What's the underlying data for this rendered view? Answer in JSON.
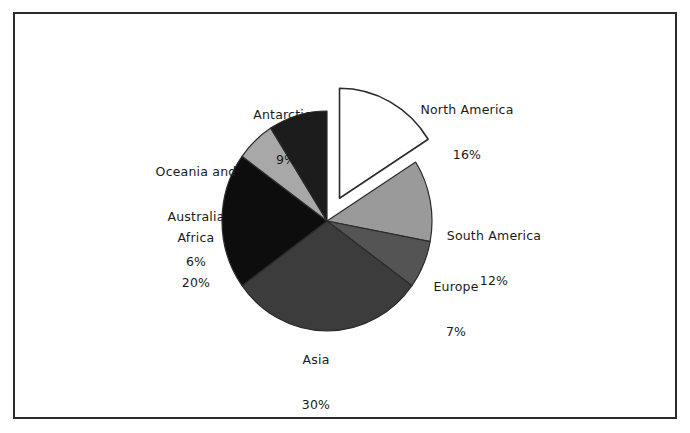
{
  "figure": {
    "background_color": "#ffffff",
    "border_color": "#2b2b2b",
    "label_text_color": "#1a1a1a"
  },
  "chart_data": {
    "type": "pie",
    "title": "",
    "subtitle": "",
    "xlabel": "",
    "ylabel": "",
    "legend_position": "none",
    "grid": false,
    "value_unit": "%",
    "start_angle_deg": 0,
    "direction": "clockwise",
    "labels_inline": true,
    "categories": [
      "North America",
      "South America",
      "Europe",
      "Asia",
      "Africa",
      "Oceania and Australia",
      "Antarctica"
    ],
    "values": [
      16,
      12,
      7,
      30,
      20,
      6,
      9
    ],
    "value_labels": [
      "16%",
      "12%",
      "7%",
      "30%",
      "20%",
      "6%",
      "9%"
    ],
    "colors": [
      "#ffffff",
      "#9a9a9a",
      "#545454",
      "#3c3c3c",
      "#0d0d0d",
      "#a8a8a8",
      "#1c1c1c"
    ],
    "exploded": [
      true,
      false,
      false,
      false,
      false,
      false,
      false
    ],
    "slices": [
      {
        "name": "North America",
        "value": 16,
        "value_label": "16%",
        "color": "#ffffff",
        "edge_color": "#2b2b2b",
        "exploded": true,
        "label_lines": [
          "North America",
          "16%"
        ]
      },
      {
        "name": "South America",
        "value": 12,
        "value_label": "12%",
        "color": "#9a9a9a",
        "edge_color": "#2b2b2b",
        "exploded": false,
        "label_lines": [
          "South America",
          "12%"
        ]
      },
      {
        "name": "Europe",
        "value": 7,
        "value_label": "7%",
        "color": "#545454",
        "edge_color": "#2b2b2b",
        "exploded": false,
        "label_lines": [
          "Europe",
          "7%"
        ]
      },
      {
        "name": "Asia",
        "value": 30,
        "value_label": "30%",
        "color": "#3c3c3c",
        "edge_color": "#2b2b2b",
        "exploded": false,
        "label_lines": [
          "Asia",
          "30%"
        ]
      },
      {
        "name": "Africa",
        "value": 20,
        "value_label": "20%",
        "color": "#0d0d0d",
        "edge_color": "#2b2b2b",
        "exploded": false,
        "label_lines": [
          "Africa",
          "20%"
        ]
      },
      {
        "name": "Oceania and Australia",
        "value": 6,
        "value_label": "6%",
        "color": "#a8a8a8",
        "edge_color": "#2b2b2b",
        "exploded": false,
        "label_lines": [
          "Oceania and",
          "Australia",
          "6%"
        ]
      },
      {
        "name": "Antarctica",
        "value": 9,
        "value_label": "9%",
        "color": "#1c1c1c",
        "edge_color": "#2b2b2b",
        "exploded": false,
        "label_lines": [
          "Antarctica",
          "9%"
        ]
      }
    ]
  },
  "labels": {
    "north_america": {
      "name": "North America",
      "pct": "16%"
    },
    "south_america": {
      "name": "South America",
      "pct": "12%"
    },
    "europe": {
      "name": "Europe",
      "pct": "7%"
    },
    "asia": {
      "name": "Asia",
      "pct": "30%"
    },
    "africa": {
      "name": "Africa",
      "pct": "20%"
    },
    "oceania": {
      "name_line1": "Oceania and",
      "name_line2": "Australia",
      "pct": "6%"
    },
    "antarctica": {
      "name": "Antarctica",
      "pct": "9%"
    }
  }
}
